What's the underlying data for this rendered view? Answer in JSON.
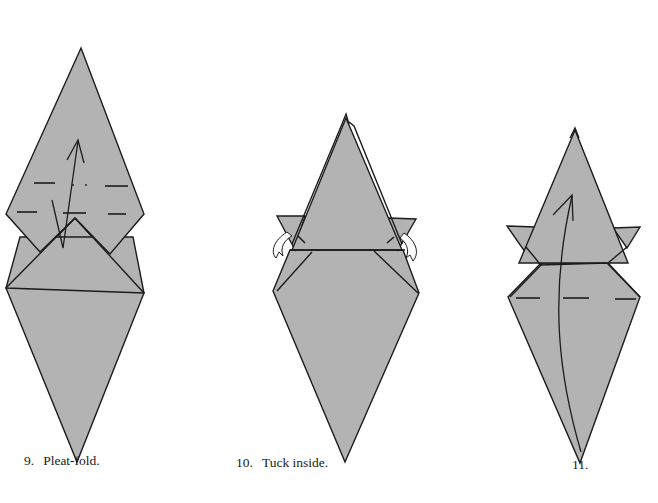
{
  "colors": {
    "paper": "#b3b3b3",
    "line": "#1c1c1c",
    "background": "#ffffff"
  },
  "steps": [
    {
      "number": "9.",
      "instruction": "Pleat-fold.",
      "symbols": [
        "valley-fold-dashes",
        "pleat-arrow-up"
      ]
    },
    {
      "number": "10.",
      "instruction": "Tuck inside.",
      "symbols": [
        "tuck-arrows-left-right"
      ]
    },
    {
      "number": "11.",
      "instruction": "",
      "symbols": [
        "valley-fold-dashes",
        "curved-arrow-up"
      ]
    }
  ]
}
